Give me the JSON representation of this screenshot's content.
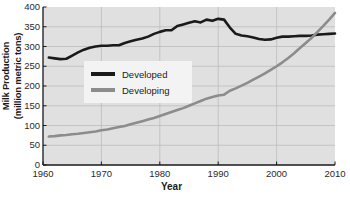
{
  "chart_data": {
    "type": "line",
    "title": "",
    "xlabel": "Year",
    "ylabel": "Milk Production\n(million metric tons)",
    "ylabel_line1": "Milk Production",
    "ylabel_line2": "(million metric tons)",
    "xlim": [
      1960,
      2010
    ],
    "ylim": [
      0,
      400
    ],
    "xticks": [
      1960,
      1970,
      1980,
      1990,
      2000,
      2010
    ],
    "xticklabels": [
      "1960",
      "1970",
      "1980",
      "1990",
      "2000",
      "2010"
    ],
    "yticks": [
      0,
      50,
      100,
      150,
      200,
      250,
      300,
      350,
      400
    ],
    "yticklabels": [
      "0",
      "50",
      "100",
      "150",
      "200",
      "250",
      "300",
      "350",
      "400"
    ],
    "grid": true,
    "legend_position": "center-left",
    "plot_background": "#e0e0e0",
    "grid_color": "#b8b8b8",
    "series": [
      {
        "name": "Developed",
        "color": "#1a1a1a",
        "x": [
          1961,
          1962,
          1963,
          1964,
          1965,
          1966,
          1967,
          1968,
          1969,
          1970,
          1971,
          1972,
          1973,
          1974,
          1975,
          1976,
          1977,
          1978,
          1979,
          1980,
          1981,
          1982,
          1983,
          1984,
          1985,
          1986,
          1987,
          1988,
          1989,
          1990,
          1991,
          1992,
          1993,
          1994,
          1995,
          1996,
          1997,
          1998,
          1999,
          2000,
          2001,
          2002,
          2003,
          2004,
          2005,
          2006,
          2007,
          2008,
          2009,
          2010
        ],
        "values": [
          272,
          270,
          268,
          269,
          277,
          285,
          292,
          297,
          300,
          302,
          302,
          303,
          303,
          309,
          313,
          317,
          320,
          325,
          332,
          337,
          341,
          341,
          352,
          356,
          360,
          364,
          361,
          368,
          365,
          370,
          368,
          348,
          332,
          328,
          326,
          323,
          319,
          317,
          318,
          322,
          325,
          325,
          326,
          327,
          327,
          328,
          330,
          331,
          332,
          333
        ]
      },
      {
        "name": "Developing",
        "color": "#8c8c8c",
        "x": [
          1961,
          1962,
          1963,
          1964,
          1965,
          1966,
          1967,
          1968,
          1969,
          1970,
          1971,
          1972,
          1973,
          1974,
          1975,
          1976,
          1977,
          1978,
          1979,
          1980,
          1981,
          1982,
          1983,
          1984,
          1985,
          1986,
          1987,
          1988,
          1989,
          1990,
          1991,
          1992,
          1993,
          1994,
          1995,
          1996,
          1997,
          1998,
          1999,
          2000,
          2001,
          2002,
          2003,
          2004,
          2005,
          2006,
          2007,
          2008,
          2009,
          2010
        ],
        "values": [
          72,
          73,
          75,
          76,
          78,
          79,
          81,
          83,
          85,
          88,
          90,
          93,
          96,
          99,
          103,
          107,
          111,
          115,
          119,
          124,
          129,
          134,
          139,
          144,
          150,
          156,
          162,
          168,
          172,
          176,
          178,
          188,
          194,
          201,
          208,
          216,
          224,
          232,
          241,
          250,
          260,
          271,
          283,
          296,
          309,
          322,
          337,
          352,
          368,
          385
        ]
      }
    ],
    "legend": [
      {
        "label": "Developed",
        "color": "#1a1a1a"
      },
      {
        "label": "Developing",
        "color": "#8c8c8c"
      }
    ]
  }
}
